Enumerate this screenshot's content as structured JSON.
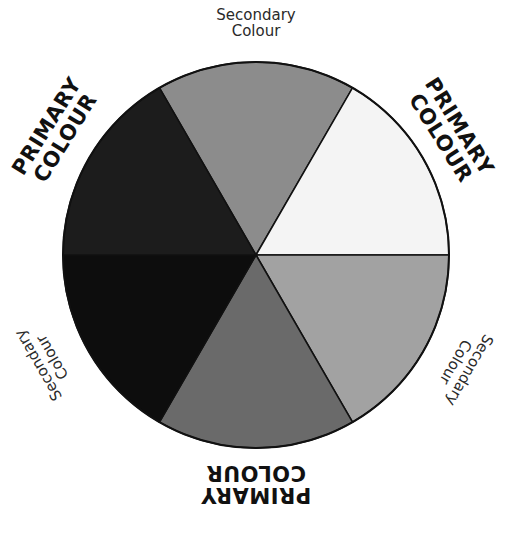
{
  "diagram": {
    "type": "colour-wheel",
    "center": [
      256,
      255
    ],
    "radius": 193,
    "segments": [
      {
        "id": "top",
        "role": "secondary",
        "start_deg": 240,
        "end_deg": 300,
        "fill": "#8c8c8c"
      },
      {
        "id": "top-right",
        "role": "primary",
        "start_deg": 300,
        "end_deg": 360,
        "fill": "#f4f4f4"
      },
      {
        "id": "bottom-right",
        "role": "secondary",
        "start_deg": 0,
        "end_deg": 60,
        "fill": "#a2a2a2"
      },
      {
        "id": "bottom",
        "role": "primary",
        "start_deg": 60,
        "end_deg": 120,
        "fill": "#6a6a6a"
      },
      {
        "id": "bottom-left",
        "role": "secondary",
        "start_deg": 120,
        "end_deg": 180,
        "fill": "#0d0d0d"
      },
      {
        "id": "top-left",
        "role": "primary",
        "start_deg": 180,
        "end_deg": 240,
        "fill": "#1c1c1c"
      }
    ],
    "stroke": "#111111"
  },
  "labels": {
    "top": {
      "line1": "Secondary",
      "line2": "Colour"
    },
    "top_left": {
      "line1": "PRIMARY",
      "line2": "COLOUR"
    },
    "top_right": {
      "line1": "PRIMARY",
      "line2": "COLOUR"
    },
    "bottom_left": {
      "line1": "Secondary",
      "line2": "Colour"
    },
    "bottom_right": {
      "line1": "Secondary",
      "line2": "Colour"
    },
    "bottom": {
      "line1": "PRIMARY",
      "line2": "COLOUR"
    }
  }
}
